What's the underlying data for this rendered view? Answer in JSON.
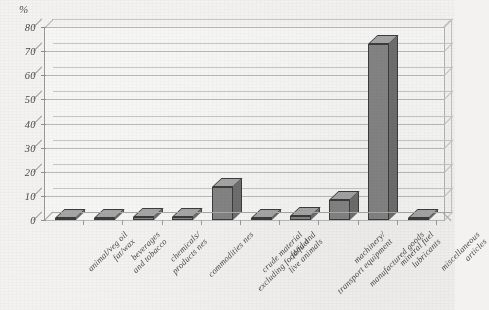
{
  "chart_data": {
    "type": "bar",
    "title": "",
    "subtitle": "",
    "xlabel": "",
    "ylabel": "%",
    "unit": "%",
    "ylim": [
      0,
      80
    ],
    "yticks": [
      0,
      10,
      20,
      30,
      40,
      50,
      60,
      70,
      80
    ],
    "ytick_labels": [
      "0",
      "10",
      "20",
      "30",
      "40",
      "50",
      "60",
      "70",
      "80"
    ],
    "grid": true,
    "legend": false,
    "legend_position": "none",
    "style": "3d-bar",
    "categories": [
      "animal/veg oil\nfat/wax",
      "beverages\nand tobacco",
      "chemicals/\nproducts nes",
      "commodities nes",
      "crude material\nexcluding food/fuel",
      "food and\nlive animals",
      "machinery/\ntransport equipment",
      "manufactured goods",
      "mineral fuel\nlubricants",
      "miscellaneous\narticles"
    ],
    "values": [
      0.9,
      1.0,
      1.1,
      1.2,
      13.7,
      1.0,
      1.6,
      8.3,
      73.0,
      0.8
    ],
    "series": [
      {
        "name": "share",
        "values": [
          0.9,
          1.0,
          1.1,
          1.2,
          13.7,
          1.0,
          1.6,
          8.3,
          73.0,
          0.8
        ]
      }
    ],
    "colors": {
      "bar_face": "#848484",
      "bar_side": "#6e6e6e",
      "bar_top": "#a5a5a5",
      "bar_outline": "#3c3c3c",
      "gridline": "#b9b9b9",
      "axis": "#9a9a9a",
      "background": "#f3f2f0",
      "text": "#474747"
    }
  }
}
